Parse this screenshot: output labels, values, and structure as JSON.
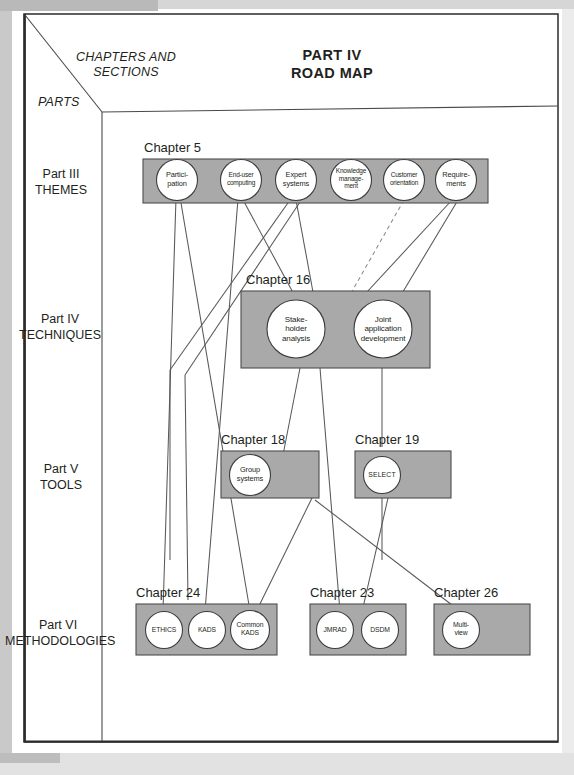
{
  "page": {
    "header": {
      "axis_label_chapters": "CHAPTERS AND\nSECTIONS",
      "axis_label_parts": "PARTS",
      "title_line1": "PART IV",
      "title_line2": "ROAD MAP"
    },
    "colors": {
      "band_fill": "#a9a9a9",
      "band_stroke": "#4d4d4d",
      "node_fill": "#ffffff",
      "node_stroke": "#3d3d3d",
      "line": "#58585a",
      "frame": "#2b2b2b",
      "text": "#231f20"
    },
    "rows": [
      {
        "part": "Part III",
        "part_name": "THEMES",
        "bands": [
          {
            "chapter": "Chapter 5",
            "nodes": [
              {
                "id": "participation",
                "label": "Partici-\npation"
              },
              {
                "id": "end-user-computing",
                "label": "End-user\ncomputing"
              },
              {
                "id": "expert-systems",
                "label": "Expert\nsystems"
              },
              {
                "id": "knowledge-management",
                "label": "Knowledge\nmanage-\nment"
              },
              {
                "id": "customer-orientation",
                "label": "Customer\norientation"
              },
              {
                "id": "requirements",
                "label": "Require-\nments"
              }
            ]
          }
        ]
      },
      {
        "part": "Part IV",
        "part_name": "TECHNIQUES",
        "bands": [
          {
            "chapter": "Chapter 16",
            "nodes": [
              {
                "id": "stakeholder-analysis",
                "label": "Stake-\nholder\nanalysis"
              },
              {
                "id": "joint-application-development",
                "label": "Joint\napplication\ndevelopment"
              }
            ]
          }
        ]
      },
      {
        "part": "Part V",
        "part_name": "TOOLS",
        "bands": [
          {
            "chapter": "Chapter 18",
            "nodes": [
              {
                "id": "group-systems",
                "label": "Group\nsystems"
              }
            ]
          },
          {
            "chapter": "Chapter 19",
            "nodes": [
              {
                "id": "select",
                "label": "SELECT"
              }
            ]
          }
        ]
      },
      {
        "part": "Part VI",
        "part_name": "METHODOLOGIES",
        "bands": [
          {
            "chapter": "Chapter 24",
            "nodes": [
              {
                "id": "ethics",
                "label": "ETHICS"
              },
              {
                "id": "kads",
                "label": "KADS"
              },
              {
                "id": "common-kads",
                "label": "Common\nKADS"
              }
            ]
          },
          {
            "chapter": "Chapter 23",
            "nodes": [
              {
                "id": "jmrad",
                "label": "JMRAD"
              },
              {
                "id": "dsdm",
                "label": "DSDM"
              }
            ]
          },
          {
            "chapter": "Chapter 26",
            "nodes": [
              {
                "id": "multiview",
                "label": "Multi-\nview"
              }
            ]
          }
        ]
      }
    ]
  }
}
